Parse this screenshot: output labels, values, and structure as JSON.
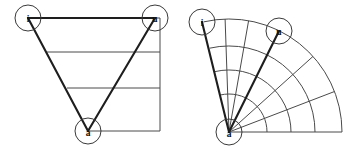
{
  "figure": {
    "width": 343,
    "height": 154,
    "background_color": "#ffffff",
    "line_color": "#4a4a4a",
    "edge_color": "#1e1e1e",
    "label_color": "#111111"
  },
  "panels": [
    {
      "id": "left",
      "name": "triangular-vowel-chart",
      "origin_x": 0,
      "nodes": [
        {
          "id": "i",
          "label": "i",
          "cx": 28,
          "cy": 18,
          "r": 13
        },
        {
          "id": "u",
          "label": "u",
          "cx": 155,
          "cy": 18,
          "r": 13
        },
        {
          "id": "a",
          "label": "a",
          "cx": 88,
          "cy": 131,
          "r": 13
        }
      ],
      "triangle_edges": [
        {
          "name": "edge-i-u",
          "x1": 28,
          "y1": 18,
          "x2": 155,
          "y2": 18
        },
        {
          "name": "edge-i-a",
          "x1": 28,
          "y1": 18,
          "x2": 88,
          "y2": 131
        },
        {
          "name": "edge-u-a",
          "x1": 155,
          "y1": 18,
          "x2": 88,
          "y2": 131
        }
      ],
      "horizontal_lines": [
        {
          "name": "level-1",
          "x1": 28,
          "y1": 18,
          "x2": 160,
          "y2": 18
        },
        {
          "name": "level-2",
          "x1": 47,
          "y1": 52,
          "x2": 160,
          "y2": 52
        },
        {
          "name": "level-3",
          "x1": 67,
          "y1": 88,
          "x2": 160,
          "y2": 88
        },
        {
          "name": "level-4",
          "x1": 88,
          "y1": 131,
          "x2": 160,
          "y2": 131
        }
      ],
      "vertical_lines": [
        {
          "name": "right-edge",
          "x1": 160,
          "y1": 18,
          "x2": 160,
          "y2": 131
        }
      ]
    },
    {
      "id": "right",
      "name": "radial-vowel-chart",
      "origin_x": 171,
      "apex": {
        "cx": 58,
        "cy": 132
      },
      "nodes": [
        {
          "id": "i",
          "label": "i",
          "cx": 31,
          "cy": 22,
          "r": 13
        },
        {
          "id": "u",
          "label": "u",
          "cx": 108,
          "cy": 31,
          "r": 13
        },
        {
          "id": "a",
          "label": "a",
          "cx": 58,
          "cy": 132,
          "r": 13
        }
      ],
      "spoke_angles_deg": [
        103,
        92,
        80,
        63,
        42,
        21,
        0
      ],
      "arc_radii": [
        38,
        62,
        86,
        113
      ],
      "bold_spoke_angles_deg": [
        103,
        63
      ],
      "outer_radius": 113,
      "sweep_start_deg": 0,
      "sweep_end_deg": 103
    }
  ],
  "labels": {
    "close_front": "i",
    "close_back": "u",
    "open": "a"
  }
}
